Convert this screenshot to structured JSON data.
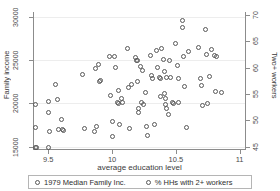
{
  "chart_data": {
    "type": "scatter",
    "title": "",
    "xlabel": "average education level",
    "ylabel": "Family income",
    "ylabel_right": "Two+ workers",
    "xlim": [
      9.38,
      11.05
    ],
    "ylim": [
      14600,
      30600
    ],
    "ylim_right": [
      44.4,
      70.5
    ],
    "grid": "horizontal-faint",
    "legend_position": "bottom",
    "xticks": [
      9.5,
      10,
      10.5,
      11
    ],
    "xticklabels": [
      "9.5",
      "10",
      "10.5",
      "11"
    ],
    "yticks": [
      15000,
      20000,
      25000,
      30000
    ],
    "yticklabels": [
      "15000",
      "20000",
      "25000",
      "30000"
    ],
    "yticks_right": [
      45,
      50,
      55,
      60,
      65,
      70
    ],
    "yticklabels_right": [
      "45",
      "50",
      "55",
      "60",
      "65",
      "70"
    ],
    "marker": "open-circle",
    "marker_color": "#585858",
    "series": [
      {
        "name": "1979 Median Family Inc.",
        "axis": "left",
        "points": [
          [
            9.4,
            19900
          ],
          [
            9.4,
            17200
          ],
          [
            9.4,
            14900
          ],
          [
            9.41,
            14850
          ],
          [
            9.5,
            20200
          ],
          [
            9.5,
            18950
          ],
          [
            9.5,
            14900
          ],
          [
            9.51,
            16800
          ],
          [
            9.56,
            22250
          ],
          [
            9.57,
            20450
          ],
          [
            9.58,
            16950
          ],
          [
            9.6,
            18150
          ],
          [
            9.61,
            17000
          ],
          [
            9.62,
            16850
          ],
          [
            9.77,
            23300
          ],
          [
            9.78,
            17050
          ],
          [
            9.86,
            16800
          ],
          [
            9.87,
            24050
          ],
          [
            9.88,
            17350
          ],
          [
            9.89,
            24550
          ],
          [
            9.9,
            22550
          ],
          [
            9.91,
            22650
          ],
          [
            9.98,
            25450
          ],
          [
            9.99,
            20900
          ],
          [
            10.0,
            16150
          ],
          [
            10.0,
            17900
          ],
          [
            10.02,
            25450
          ],
          [
            10.03,
            24200
          ],
          [
            10.04,
            20150
          ],
          [
            10.05,
            21550
          ],
          [
            10.05,
            19950
          ],
          [
            10.06,
            17550
          ],
          [
            10.07,
            20600
          ],
          [
            10.08,
            20050
          ]
        ]
      },
      {
        "name": "% HHs with 2+ workers",
        "axis": "right",
        "points": [
          [
            10.12,
            26400
          ],
          [
            10.13,
            21800
          ],
          [
            10.14,
            17050
          ],
          [
            10.15,
            22150
          ],
          [
            10.18,
            25300
          ],
          [
            10.19,
            25000
          ],
          [
            10.2,
            24950
          ],
          [
            10.2,
            22600
          ],
          [
            10.21,
            19450
          ],
          [
            10.21,
            19000
          ],
          [
            10.22,
            24300
          ],
          [
            10.23,
            20050
          ],
          [
            10.24,
            23850
          ],
          [
            10.25,
            19850
          ],
          [
            10.26,
            21300
          ],
          [
            10.27,
            17350
          ],
          [
            10.28,
            16300
          ],
          [
            10.3,
            25600
          ],
          [
            10.31,
            23200
          ],
          [
            10.32,
            22900
          ],
          [
            10.33,
            17500
          ],
          [
            10.35,
            26150
          ],
          [
            10.36,
            24150
          ],
          [
            10.37,
            23000
          ],
          [
            10.38,
            22850
          ],
          [
            10.38,
            20850
          ],
          [
            10.39,
            26400
          ],
          [
            10.4,
            25150
          ],
          [
            10.41,
            23750
          ],
          [
            10.41,
            21100
          ],
          [
            10.42,
            20550
          ],
          [
            10.42,
            19900
          ],
          [
            10.43,
            23050
          ],
          [
            10.43,
            19400
          ],
          [
            10.44,
            18700
          ],
          [
            10.45,
            25000
          ],
          [
            10.46,
            22950
          ],
          [
            10.47,
            20150
          ],
          [
            10.48,
            20000
          ],
          [
            10.5,
            26950
          ],
          [
            10.51,
            24400
          ],
          [
            10.52,
            20050
          ],
          [
            10.52,
            22900
          ],
          [
            10.55,
            29650
          ],
          [
            10.55,
            28800
          ],
          [
            10.56,
            25400
          ],
          [
            10.57,
            22000
          ],
          [
            10.58,
            17250
          ],
          [
            10.6,
            26050
          ],
          [
            10.68,
            26450
          ],
          [
            10.69,
            22850
          ],
          [
            10.7,
            22050
          ],
          [
            10.71,
            19800
          ],
          [
            10.73,
            28550
          ],
          [
            10.74,
            25700
          ],
          [
            10.75,
            20000
          ],
          [
            10.76,
            23150
          ],
          [
            10.78,
            26300
          ],
          [
            10.8,
            25500
          ],
          [
            10.81,
            21400
          ],
          [
            10.82,
            25400
          ],
          [
            10.86,
            21250
          ]
        ]
      }
    ]
  },
  "axes": {
    "left_title": "Family income",
    "right_title": "Two+ workers",
    "bottom_title": "average education level"
  },
  "legend": {
    "items": [
      {
        "label": "1979 Median Family Inc.",
        "marker": "open-circle"
      },
      {
        "label": "% HHs with 2+ workers",
        "marker": "open-circle"
      }
    ]
  }
}
